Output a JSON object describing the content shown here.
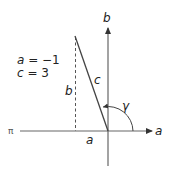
{
  "diagram": {
    "axes": {
      "vertical_label": "b",
      "horizontal_label": "a",
      "negative_real_label": "π"
    },
    "triangle": {
      "side_horizontal_label": "a",
      "side_vertical_label": "b",
      "hypotenuse_label": "c",
      "angle_label": "γ"
    },
    "given": {
      "line1_var": "a",
      "line1_rest": " = −1",
      "line2_var": "c",
      "line2_rest": " = 3"
    },
    "colors": {
      "axis": "#555555",
      "line": "#444444",
      "text": "#222222"
    }
  }
}
